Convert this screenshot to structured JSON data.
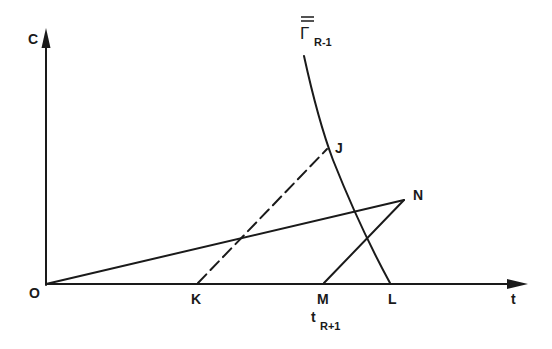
{
  "diagram": {
    "axes": {
      "y_label": "C",
      "x_label": "t",
      "origin_label": "O"
    },
    "curve": {
      "label_main": "Γ",
      "label_sub": "R-1",
      "label_overbar": "double"
    },
    "points": {
      "J": "J",
      "N": "N",
      "K": "K",
      "M": "M",
      "L": "L"
    },
    "annotations": {
      "m_time_main": "t",
      "m_time_sub": "R+1"
    },
    "lines": [
      {
        "from": "O",
        "to": "N",
        "style": "solid"
      },
      {
        "from": "K",
        "to": "J",
        "style": "dashed"
      },
      {
        "from": "M",
        "to": "N",
        "style": "solid"
      },
      {
        "from": "Γ top",
        "to": "L",
        "style": "solid-curve",
        "through": "J"
      }
    ],
    "colors": {
      "ink": "#1a1a1a",
      "background": "#ffffff"
    }
  }
}
